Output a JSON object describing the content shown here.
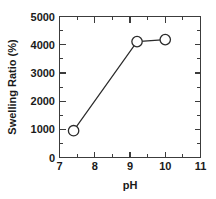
{
  "chart_data": {
    "type": "line",
    "title": "",
    "xlabel": "pH",
    "ylabel": "Swelling Ratio (%)",
    "xlim": [
      7,
      11
    ],
    "ylim": [
      0,
      5000
    ],
    "xticks": [
      7,
      8,
      9,
      10,
      11
    ],
    "xtick_labels": [
      "7",
      "8",
      "9",
      "10",
      "11"
    ],
    "yticks": [
      0,
      1000,
      2000,
      3000,
      4000,
      5000
    ],
    "ytick_labels": [
      "0",
      "1000",
      "2000",
      "3000",
      "4000",
      "5000"
    ],
    "x_minor_ticks": [
      7.5,
      8.5,
      9.5,
      10.5
    ],
    "y_minor_ticks": [
      500,
      1500,
      2500,
      3500,
      4500
    ],
    "grid": false,
    "legend": false,
    "marker": "open-circle",
    "marker_size": 5.2,
    "line_color": "#2b2b2b",
    "marker_fill": "#ffffff",
    "x": [
      7.4,
      9.2,
      10.0
    ],
    "values": [
      950,
      4110,
      4180
    ],
    "points": [
      {
        "x": 7.4,
        "y": 950
      },
      {
        "x": 9.2,
        "y": 4110
      },
      {
        "x": 10.0,
        "y": 4180
      }
    ],
    "series": [
      {
        "name": "Swelling Ratio",
        "x": [
          7.4,
          9.2,
          10.0
        ],
        "values": [
          950,
          4110,
          4180
        ]
      }
    ]
  },
  "axes": {
    "x_title": "pH",
    "y_title": "Swelling Ratio (%)"
  }
}
